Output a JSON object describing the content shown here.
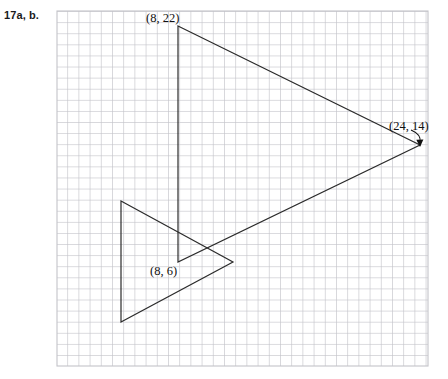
{
  "problem": {
    "label": "17a, b."
  },
  "grid": {
    "x0": 57,
    "y0": 11,
    "x1": 428,
    "y1": 366,
    "cell": 11.2,
    "minor_color": "#f0f0f2",
    "major_color": "#b9b9bf",
    "border_color": "#c2c2c8"
  },
  "figure": {
    "stroke_color": "#2b2b2b",
    "stroke_width": 1.2,
    "image_triangle": {
      "name": "large-triangle",
      "points": "178,26 420,145 178,262",
      "vertices": [
        {
          "x": 178,
          "y": 26,
          "label": "(8, 22)"
        },
        {
          "x": 420,
          "y": 145,
          "label": "(24, 14)"
        },
        {
          "x": 178,
          "y": 262,
          "label": "(8, 6)"
        }
      ]
    },
    "preimage_triangle": {
      "name": "small-triangle",
      "points": "121,201 233,262 121,322",
      "vertices": [
        {
          "x": 121,
          "y": 201,
          "label": ""
        },
        {
          "x": 233,
          "y": 262,
          "label": ""
        },
        {
          "x": 121,
          "y": 322,
          "label": ""
        }
      ]
    },
    "arrow": {
      "name": "callout-arrow",
      "path": "M 411 131 C 417 134 420 138 420 143",
      "head": "420,146 416.6,139.6 423.2,139.4"
    }
  },
  "labels": {
    "p1": "(8, 22)",
    "p2": "(24, 14)",
    "p3": "(8, 6)"
  }
}
